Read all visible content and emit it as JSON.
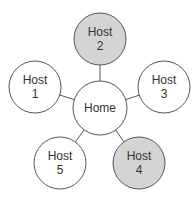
{
  "diagram": {
    "type": "star-network",
    "center": {
      "id": "home",
      "label": "Home",
      "x": 100,
      "y": 108,
      "r": 27,
      "fill": "#ffffff"
    },
    "nodes": [
      {
        "id": "host1",
        "line1": "Host",
        "line2": "1",
        "x": 35,
        "y": 87,
        "r": 26,
        "fill": "#ffffff"
      },
      {
        "id": "host2",
        "line1": "Host",
        "line2": "2",
        "x": 100,
        "y": 39,
        "r": 26,
        "fill": "#d4d4d4"
      },
      {
        "id": "host3",
        "line1": "Host",
        "line2": "3",
        "x": 164,
        "y": 87,
        "r": 26,
        "fill": "#ffffff"
      },
      {
        "id": "host4",
        "line1": "Host",
        "line2": "4",
        "x": 139,
        "y": 163,
        "r": 26,
        "fill": "#d4d4d4"
      },
      {
        "id": "host5",
        "line1": "Host",
        "line2": "5",
        "x": 60,
        "y": 163,
        "r": 26,
        "fill": "#ffffff"
      }
    ],
    "stroke": "#555555"
  }
}
